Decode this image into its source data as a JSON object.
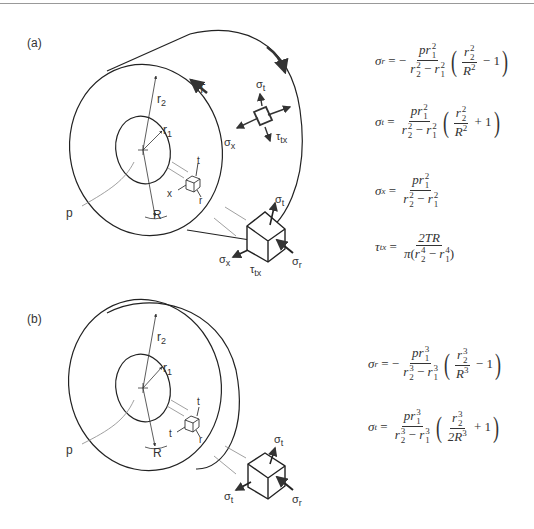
{
  "page": {
    "header_left": "",
    "header_right": ""
  },
  "figure_a": {
    "panel_label": "(a)",
    "labels": {
      "torque": "T",
      "outer_radius": "r",
      "outer_radius_sub": "2",
      "inner_radius": "r",
      "inner_radius_sub": "1",
      "pressure": "p",
      "radius": "R",
      "axis_t": "t",
      "axis_x": "x",
      "axis_r": "r",
      "sigma_t": "σ",
      "sigma_t_sub": "t",
      "sigma_x": "σ",
      "sigma_x_sub": "x",
      "tau_tx": "τ",
      "tau_tx_sub": "tx",
      "sigma_r": "σ",
      "sigma_r_sub": "r"
    },
    "equations": [
      {
        "lhs": "σ",
        "lhs_sub": "r",
        "sign": "−",
        "num": "pr",
        "num_sub": "1",
        "num_sup": "2",
        "den_a": "r",
        "den_a_sub": "2",
        "den_a_sup": "2",
        "den_b": "r",
        "den_b_sub": "1",
        "den_b_sup": "2",
        "in_num": "r",
        "in_num_sub": "2",
        "in_num_sup": "2",
        "in_den": "R",
        "in_den_sup": "2",
        "op": "− 1"
      },
      {
        "lhs": "σ",
        "lhs_sub": "t",
        "sign": "",
        "num": "pr",
        "num_sub": "1",
        "num_sup": "2",
        "den_a": "r",
        "den_a_sub": "2",
        "den_a_sup": "2",
        "den_b": "r",
        "den_b_sub": "1",
        "den_b_sup": "2",
        "in_num": "r",
        "in_num_sub": "2",
        "in_num_sup": "2",
        "in_den": "R",
        "in_den_sup": "2",
        "op": "+ 1"
      },
      {
        "lhs": "σ",
        "lhs_sub": "x",
        "num": "pr",
        "num_sub": "1",
        "num_sup": "2",
        "den_a": "r",
        "den_a_sub": "2",
        "den_a_sup": "2",
        "den_b": "r",
        "den_b_sub": "1",
        "den_b_sup": "2"
      },
      {
        "lhs": "τ",
        "lhs_sub": "tx",
        "num": "2TR",
        "den_prefix": "π",
        "den_a": "r",
        "den_a_sub": "2",
        "den_a_sup": "4",
        "den_b": "r",
        "den_b_sub": "1",
        "den_b_sup": "4"
      }
    ]
  },
  "figure_b": {
    "panel_label": "(b)",
    "labels": {
      "outer_radius": "r",
      "outer_radius_sub": "2",
      "inner_radius": "r",
      "inner_radius_sub": "1",
      "pressure": "p",
      "radius": "R",
      "axis_t_top": "t",
      "axis_t_left": "t",
      "axis_r": "r",
      "sigma_t": "σ",
      "sigma_t_sub": "t",
      "sigma_t2": "σ",
      "sigma_t2_sub": "t",
      "sigma_r": "σ",
      "sigma_r_sub": "r"
    },
    "equations": [
      {
        "lhs": "σ",
        "lhs_sub": "r",
        "sign": "−",
        "num": "pr",
        "num_sub": "1",
        "num_sup": "3",
        "den_a": "r",
        "den_a_sub": "2",
        "den_a_sup": "3",
        "den_b": "r",
        "den_b_sub": "1",
        "den_b_sup": "3",
        "in_num": "r",
        "in_num_sub": "2",
        "in_num_sup": "3",
        "in_den": "R",
        "in_den_sup": "3",
        "op": "− 1"
      },
      {
        "lhs": "σ",
        "lhs_sub": "t",
        "sign": "",
        "num": "pr",
        "num_sub": "1",
        "num_sup": "3",
        "den_a": "r",
        "den_a_sub": "2",
        "den_a_sup": "3",
        "den_b": "r",
        "den_b_sub": "1",
        "den_b_sup": "3",
        "in_num": "r",
        "in_num_sub": "2",
        "in_num_sup": "3",
        "in_den": "2R",
        "in_den_sup": "3",
        "op": "+ 1"
      }
    ]
  }
}
